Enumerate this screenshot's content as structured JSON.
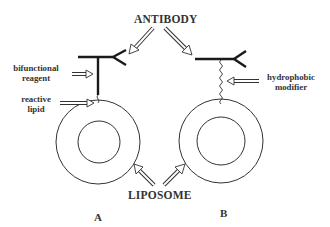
{
  "diagram": {
    "top_label": "ANTIBODY",
    "bottom_label": "LIPOSOME",
    "panels": [
      {
        "id": "A",
        "label": "A",
        "annotations": [
          {
            "line1": "bifunctional",
            "line2": "reagent"
          },
          {
            "line1": "reactive",
            "line2": "lipid"
          }
        ],
        "linker_type": "bifunctional reagent to reactive lipid"
      },
      {
        "id": "B",
        "label": "B",
        "annotations": [
          {
            "line1": "hydrophobic",
            "line2": "modifier"
          }
        ],
        "linker_type": "hydrophobic modifier"
      }
    ],
    "colors": {
      "line": "#222222",
      "text": "#333333",
      "background": "#ffffff"
    }
  }
}
